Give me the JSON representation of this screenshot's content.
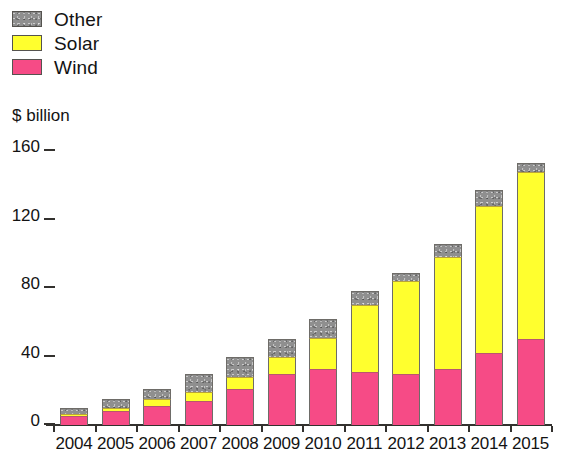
{
  "legend": {
    "position": "top-left",
    "items": [
      {
        "label": "Other",
        "color": "#8f8f8f",
        "swatch_name": "other-swatch"
      },
      {
        "label": "Solar",
        "color": "#ffff2e",
        "swatch_name": "solar-swatch"
      },
      {
        "label": "Wind",
        "color": "#f64b86",
        "swatch_name": "wind-swatch"
      }
    ]
  },
  "axis": {
    "y_title": "$ billion",
    "y_ticks": [
      "0",
      "40",
      "80",
      "120",
      "160"
    ]
  },
  "chart_data": {
    "type": "bar",
    "stacked": true,
    "title": "",
    "subtitle": "",
    "xlabel": "",
    "ylabel": "$ billion",
    "ylim": [
      0,
      160
    ],
    "ytick_values": [
      0,
      40,
      80,
      120,
      160
    ],
    "grid": false,
    "legend_position": "top-left",
    "categories": [
      "2004",
      "2005",
      "2006",
      "2007",
      "2008",
      "2009",
      "2010",
      "2011",
      "2012",
      "2013",
      "2014",
      "2015"
    ],
    "series": [
      {
        "name": "Wind",
        "color": "#f64b86",
        "values": [
          5,
          8,
          11,
          14,
          21,
          30,
          33,
          31,
          30,
          33,
          42,
          50
        ]
      },
      {
        "name": "Solar",
        "color": "#ffff2e",
        "values": [
          1,
          2,
          4,
          5,
          7,
          10,
          18,
          39,
          54,
          65,
          86,
          98
        ]
      },
      {
        "name": "Other",
        "color": "#8f8f8f",
        "values": [
          4,
          5,
          6,
          11,
          12,
          10,
          11,
          8,
          5,
          8,
          9,
          5
        ]
      }
    ],
    "totals": [
      10,
      15,
      21,
      30,
      40,
      50,
      62,
      78,
      89,
      106,
      137,
      153
    ]
  }
}
